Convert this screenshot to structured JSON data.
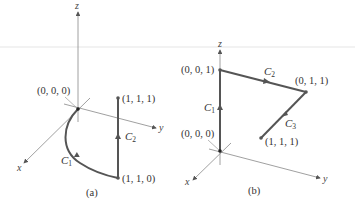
{
  "figure": {
    "panels": [
      {
        "id": "a",
        "caption": "(a)",
        "axes": {
          "x": "x",
          "y": "y",
          "z": "z"
        },
        "points": [
          {
            "label": "(0, 0, 0)"
          },
          {
            "label": "(1, 1, 1)"
          },
          {
            "label": "(1, 1, 0)"
          }
        ],
        "curves": [
          {
            "name": "C",
            "sub": "1",
            "from": "(0, 0, 0)",
            "to": "(1, 1, 0)",
            "shape": "curved"
          },
          {
            "name": "C",
            "sub": "2",
            "from": "(1, 1, 0)",
            "to": "(1, 1, 1)",
            "shape": "straight"
          }
        ]
      },
      {
        "id": "b",
        "caption": "(b)",
        "axes": {
          "x": "x",
          "y": "y",
          "z": "z"
        },
        "points": [
          {
            "label": "(0, 0, 1)"
          },
          {
            "label": "(0, 1, 1)"
          },
          {
            "label": "(0, 0, 0)"
          },
          {
            "label": "(1, 1, 1)"
          }
        ],
        "curves": [
          {
            "name": "C",
            "sub": "1",
            "from": "(0, 0, 0)",
            "to": "(0, 0, 1)",
            "shape": "straight"
          },
          {
            "name": "C",
            "sub": "2",
            "from": "(0, 0, 1)",
            "to": "(0, 1, 1)",
            "shape": "straight"
          },
          {
            "name": "C",
            "sub": "3",
            "from": "(0, 1, 1)",
            "to": "(1, 1, 1)",
            "shape": "straight"
          }
        ]
      }
    ],
    "colors": {
      "axis": "#7a7a7a",
      "curve": "#555555",
      "text": "#333333"
    }
  }
}
